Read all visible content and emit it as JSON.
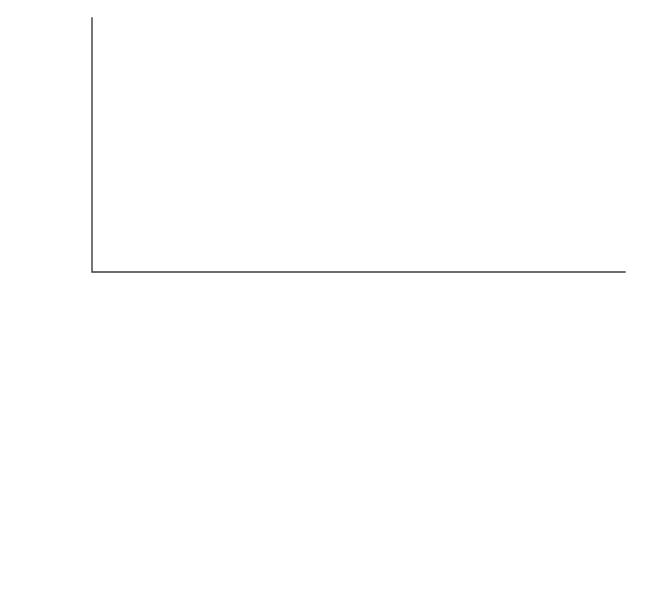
{
  "chart_data": [
    {
      "id": "temperature",
      "type": "line",
      "title": "",
      "xlabel": "fraction of the Sun's radius",
      "ylabel": "temperature (K)",
      "yscale": "log",
      "xscale": "linear",
      "xlim": [
        0,
        1.0
      ],
      "ylim": [
        300000,
        25000000
      ],
      "grid": false,
      "xticks": [
        0,
        0.2,
        0.4,
        0.6,
        0.8,
        1.0
      ],
      "xticklabels": [
        "0",
        "0.2",
        "0.4",
        "0.6",
        "0.8",
        "1.0"
      ],
      "yticks": [
        1000000,
        10000000
      ],
      "yticklabels": [
        "10⁶",
        "10⁷"
      ],
      "ytick_bases": [
        "10",
        "10"
      ],
      "ytick_exponents": [
        "6",
        "7"
      ],
      "series": [
        {
          "name": "data",
          "style": "solid",
          "color": "#c9c9c9",
          "x": [
            0.04,
            0.08,
            0.12,
            0.16,
            0.2,
            0.25,
            0.3,
            0.35,
            0.4,
            0.45,
            0.5,
            0.55,
            0.6,
            0.65,
            0.71,
            0.75,
            0.79,
            0.83,
            0.86,
            0.89,
            0.91,
            0.925,
            0.935,
            0.942
          ],
          "y": [
            16000000,
            15600000,
            14600000,
            13200000,
            11600000,
            9400000,
            7800000,
            6600000,
            5700000,
            5000000,
            4400000,
            3900000,
            3450000,
            3000000,
            2500000,
            2250000,
            2000000,
            1700000,
            1420000,
            1120000,
            900000,
            720000,
            560000,
            420000
          ]
        },
        {
          "name": "model",
          "style": "dashed",
          "color": "#3a3a3a",
          "x": [
            0.04,
            0.08,
            0.12,
            0.16,
            0.2,
            0.25,
            0.3,
            0.35,
            0.4,
            0.45,
            0.5,
            0.55,
            0.6,
            0.65,
            0.71,
            0.75,
            0.79,
            0.83,
            0.86,
            0.89,
            0.91,
            0.925,
            0.935,
            0.942
          ],
          "y": [
            16000000,
            15600000,
            14600000,
            13200000,
            11600000,
            9400000,
            7800000,
            6600000,
            5700000,
            5000000,
            4400000,
            3900000,
            3450000,
            3000000,
            2500000,
            2250000,
            2000000,
            1700000,
            1420000,
            1120000,
            900000,
            720000,
            560000,
            420000
          ]
        }
      ],
      "zones": [
        {
          "label": "core",
          "label_lines": [
            "core"
          ],
          "x_center": 0.125
        },
        {
          "label": "radiation zone",
          "label_lines": [
            "radiation",
            "zone"
          ],
          "x_center": 0.465
        },
        {
          "label": "convection zone",
          "label_lines": [
            "convection",
            "zone"
          ],
          "x_center": 0.845
        }
      ],
      "zone_boundaries": [
        0.25,
        0.71
      ]
    },
    {
      "id": "density",
      "type": "line",
      "title": "",
      "xlabel": "fraction of the Sun's radius",
      "ylabel": "density (g/cm³)",
      "ylabel_base": "density (g/cm",
      "ylabel_sup": "3",
      "ylabel_tail": ")",
      "yscale": "log",
      "xscale": "linear",
      "xlim": [
        0,
        1.0
      ],
      "ylim": [
        0.006,
        260
      ],
      "grid": false,
      "xticks": [
        0,
        0.2,
        0.4,
        0.6,
        0.8,
        1.0
      ],
      "xticklabels": [
        "0",
        "0.2",
        "0.4",
        "0.6",
        "0.8",
        "1.0"
      ],
      "yticks": [
        0.01,
        0.1,
        1,
        10,
        100
      ],
      "yticklabels": [
        "0.01",
        "0.1",
        "1",
        "10",
        "100"
      ],
      "series": [
        {
          "name": "data",
          "style": "solid",
          "color": "#c9c9c9",
          "x": [
            0.035,
            0.07,
            0.11,
            0.15,
            0.2,
            0.25,
            0.3,
            0.35,
            0.4,
            0.45,
            0.5,
            0.55,
            0.6,
            0.65,
            0.71,
            0.75,
            0.79,
            0.83,
            0.86,
            0.89,
            0.91,
            0.925,
            0.935,
            0.942
          ],
          "y": [
            142,
            128,
            104,
            78,
            52,
            30,
            18,
            10.5,
            6.2,
            3.7,
            2.2,
            1.35,
            0.82,
            0.5,
            0.27,
            0.185,
            0.125,
            0.082,
            0.056,
            0.036,
            0.025,
            0.018,
            0.013,
            0.0095
          ]
        },
        {
          "name": "model",
          "style": "dashed",
          "color": "#3a3a3a",
          "x": [
            0.035,
            0.07,
            0.11,
            0.15,
            0.2,
            0.25,
            0.3,
            0.35,
            0.4,
            0.45,
            0.5,
            0.55,
            0.6,
            0.65,
            0.71,
            0.75,
            0.79,
            0.83,
            0.86,
            0.89,
            0.91,
            0.925,
            0.935,
            0.942
          ],
          "y": [
            142,
            128,
            104,
            78,
            52,
            30,
            18,
            10.5,
            6.2,
            3.7,
            2.2,
            1.35,
            0.82,
            0.5,
            0.27,
            0.185,
            0.125,
            0.082,
            0.056,
            0.036,
            0.025,
            0.018,
            0.013,
            0.0095
          ]
        }
      ],
      "zones": [
        {
          "label": "core",
          "label_lines": [
            "core"
          ],
          "x_center": 0.125
        },
        {
          "label": "radiation zone",
          "label_lines": [
            "radiation",
            "zone"
          ],
          "x_center": 0.465
        },
        {
          "label": "convection zone",
          "label_lines": [
            "convection",
            "zone"
          ],
          "x_center": 0.845
        }
      ],
      "zone_boundaries": [
        0.25,
        0.71
      ]
    }
  ],
  "legend": {
    "title": "Key",
    "position": "top-right",
    "entries": [
      {
        "label": "model",
        "style": "dashed",
        "color": "#3a3a3a"
      },
      {
        "label": "data",
        "style": "solid",
        "color": "#c9c9c9"
      }
    ]
  },
  "colors": {
    "model": "#3a3a3a",
    "data": "#c9c9c9",
    "axis": "#3c3c3c",
    "divider": "#5a5a5a",
    "background": "#ffffff"
  },
  "xaxis_title": "fraction of the Sun's radius"
}
